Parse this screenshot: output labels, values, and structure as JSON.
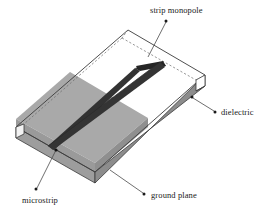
{
  "figure": {
    "type": "3d-schematic-diagram"
  },
  "labels": {
    "strip_monopole": "strip monopole",
    "dielectric": "dielectric",
    "microstrip": "microstrip",
    "ground_plane": "ground plane"
  },
  "colors": {
    "ground_plane_fill": "#a9a9a9",
    "ground_plane_side_fill": "#9a9a9a",
    "ground_plane_front_fill": "#8f8f8f",
    "dielectric_fill": "#ffffff",
    "strip_fill": "#333333",
    "strip_dark": "#262626",
    "outline": "#3b3b3b",
    "leader": "#4a4a4a",
    "text": "#1a1a1a"
  },
  "geometry": {
    "substrate_top_back": [
      128,
      30
    ],
    "substrate_top_left": [
      16,
      127
    ],
    "substrate_top_right": [
      205,
      75
    ],
    "substrate_top_front": [
      95,
      172
    ],
    "substrate_thickness_px": 11,
    "ground_plane_coverage": "front-left half of top surface",
    "strip_runs": "from front-left edge to mid-board, continuing as monopole over bare dielectric"
  }
}
